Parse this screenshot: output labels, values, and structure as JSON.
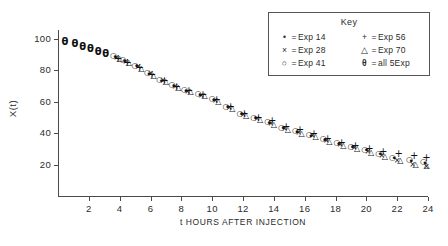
{
  "chart_data": {
    "type": "scatter",
    "title": "",
    "xlabel": "t HOURS AFTER INJECTION",
    "ylabel": "X(t)",
    "xlim": [
      0,
      24
    ],
    "ylim": [
      0,
      105
    ],
    "xticks": [
      2,
      4,
      6,
      8,
      10,
      12,
      14,
      16,
      18,
      20,
      22,
      24
    ],
    "xtick_labels": [
      "2",
      "4",
      "6",
      "8",
      "10",
      "12",
      "14",
      "16",
      "18",
      "20",
      "22",
      "24"
    ],
    "yticks": [
      20,
      40,
      60,
      80,
      100
    ],
    "ytick_labels": [
      "20",
      "40",
      "60",
      "80",
      "100"
    ],
    "grid": false,
    "legend": {
      "title": "Key",
      "position": "top-right",
      "entries": [
        {
          "symbol": "•",
          "marker": "dot",
          "equals": "=",
          "label": "Exp 14"
        },
        {
          "symbol": "×",
          "marker": "cross",
          "equals": "=",
          "label": "Exp 28"
        },
        {
          "symbol": "○",
          "marker": "circle",
          "equals": "=",
          "label": "Exp 41"
        },
        {
          "symbol": "+",
          "marker": "plus",
          "equals": "=",
          "label": "Exp 56"
        },
        {
          "symbol": "△",
          "marker": "triangle",
          "equals": "=",
          "label": "Exp 70"
        },
        {
          "symbol": "θ",
          "marker": "theta",
          "equals": "=",
          "label": "all 5Exp"
        }
      ]
    },
    "series": [
      {
        "name": "all 5Exp",
        "marker": "theta",
        "points": [
          [
            0.45,
            98.0
          ],
          [
            1.1,
            96.5
          ],
          [
            1.6,
            95.0
          ],
          [
            2.1,
            93.5
          ],
          [
            2.6,
            92.0
          ],
          [
            3.1,
            90.5
          ]
        ]
      },
      {
        "name": "Exp 14",
        "marker": "dot",
        "points": [
          [
            3.7,
            88.5
          ],
          [
            4.3,
            86.0
          ],
          [
            5.1,
            82.5
          ],
          [
            5.9,
            78.0
          ],
          [
            6.7,
            73.5
          ],
          [
            7.5,
            70.0
          ],
          [
            8.3,
            67.0
          ],
          [
            9.2,
            64.5
          ],
          [
            10.1,
            61.0
          ],
          [
            11.0,
            56.5
          ],
          [
            11.9,
            52.0
          ],
          [
            12.8,
            49.5
          ],
          [
            13.7,
            46.5
          ],
          [
            14.6,
            43.0
          ],
          [
            15.5,
            41.0
          ],
          [
            16.4,
            38.5
          ],
          [
            17.3,
            35.5
          ],
          [
            18.2,
            33.0
          ],
          [
            19.1,
            31.0
          ],
          [
            20.0,
            29.0
          ],
          [
            20.9,
            26.5
          ],
          [
            21.8,
            24.0
          ],
          [
            22.9,
            22.5
          ],
          [
            23.8,
            21.0
          ]
        ]
      },
      {
        "name": "Exp 28",
        "marker": "cross",
        "points": [
          [
            3.8,
            88.0
          ],
          [
            4.4,
            85.5
          ],
          [
            5.2,
            82.0
          ],
          [
            6.0,
            77.5
          ],
          [
            6.8,
            73.0
          ],
          [
            7.6,
            69.5
          ],
          [
            8.4,
            66.5
          ],
          [
            9.3,
            64.0
          ],
          [
            10.2,
            60.5
          ],
          [
            11.1,
            56.0
          ],
          [
            12.0,
            51.5
          ],
          [
            12.9,
            49.0
          ],
          [
            13.8,
            46.0
          ],
          [
            14.7,
            42.5
          ],
          [
            15.6,
            40.0
          ],
          [
            16.5,
            38.0
          ],
          [
            17.4,
            35.0
          ],
          [
            18.3,
            32.5
          ],
          [
            19.2,
            30.5
          ],
          [
            20.1,
            28.0
          ],
          [
            21.0,
            25.5
          ],
          [
            22.0,
            22.5
          ],
          [
            23.0,
            19.5
          ],
          [
            23.9,
            18.5
          ]
        ]
      },
      {
        "name": "Exp 41",
        "marker": "circle",
        "points": [
          [
            3.6,
            89.0
          ],
          [
            4.2,
            86.5
          ],
          [
            5.0,
            83.0
          ],
          [
            5.8,
            78.5
          ],
          [
            6.6,
            74.0
          ],
          [
            7.4,
            70.5
          ],
          [
            8.2,
            67.5
          ],
          [
            9.1,
            65.0
          ],
          [
            10.0,
            61.5
          ],
          [
            10.9,
            57.0
          ],
          [
            11.8,
            52.5
          ],
          [
            12.7,
            50.0
          ],
          [
            13.6,
            47.0
          ],
          [
            14.5,
            43.5
          ],
          [
            15.4,
            41.5
          ],
          [
            16.3,
            39.0
          ],
          [
            17.2,
            36.0
          ],
          [
            18.1,
            33.5
          ],
          [
            19.0,
            31.5
          ],
          [
            19.9,
            29.5
          ],
          [
            20.8,
            27.0
          ],
          [
            21.7,
            24.5
          ],
          [
            22.8,
            23.0
          ],
          [
            23.7,
            21.5
          ]
        ]
      },
      {
        "name": "Exp 56",
        "marker": "plus",
        "points": [
          [
            3.9,
            87.5
          ],
          [
            4.5,
            85.0
          ],
          [
            5.3,
            81.5
          ],
          [
            6.1,
            77.0
          ],
          [
            6.9,
            73.0
          ],
          [
            7.7,
            69.5
          ],
          [
            8.5,
            67.0
          ],
          [
            9.4,
            64.5
          ],
          [
            10.3,
            61.0
          ],
          [
            11.2,
            57.0
          ],
          [
            12.1,
            52.5
          ],
          [
            13.0,
            50.0
          ],
          [
            13.9,
            47.5
          ],
          [
            14.8,
            44.0
          ],
          [
            15.7,
            42.0
          ],
          [
            16.6,
            39.5
          ],
          [
            17.5,
            36.5
          ],
          [
            18.4,
            34.0
          ],
          [
            19.3,
            32.0
          ],
          [
            20.2,
            30.0
          ],
          [
            21.1,
            28.0
          ],
          [
            22.1,
            26.5
          ],
          [
            23.1,
            25.5
          ],
          [
            23.9,
            24.5
          ]
        ]
      },
      {
        "name": "Exp 70",
        "marker": "triangle",
        "points": [
          [
            4.0,
            87.0
          ],
          [
            4.6,
            84.5
          ],
          [
            5.4,
            81.0
          ],
          [
            6.2,
            76.5
          ],
          [
            7.0,
            72.5
          ],
          [
            7.8,
            69.0
          ],
          [
            8.6,
            66.0
          ],
          [
            9.5,
            63.5
          ],
          [
            10.4,
            60.0
          ],
          [
            11.3,
            55.5
          ],
          [
            12.2,
            51.0
          ],
          [
            13.1,
            48.5
          ],
          [
            14.0,
            45.5
          ],
          [
            14.9,
            42.0
          ],
          [
            15.8,
            39.5
          ],
          [
            16.7,
            37.5
          ],
          [
            17.6,
            34.5
          ],
          [
            18.5,
            32.0
          ],
          [
            19.4,
            30.0
          ],
          [
            20.3,
            27.5
          ],
          [
            21.2,
            25.0
          ],
          [
            22.2,
            22.0
          ],
          [
            23.2,
            19.5
          ],
          [
            23.9,
            19.0
          ]
        ]
      }
    ]
  }
}
